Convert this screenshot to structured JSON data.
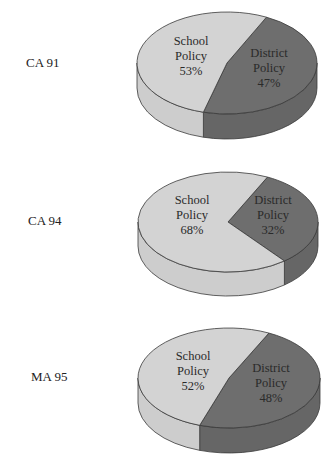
{
  "colors": {
    "school_top": "#d3d3d3",
    "school_side": "#cdcdcd",
    "district_top": "#6e6e6e",
    "district_side": "#666666",
    "outline": "#3a3a3a"
  },
  "chart_data": [
    {
      "type": "pie",
      "title": "CA 91",
      "categories": [
        "School Policy",
        "District Policy"
      ],
      "values": [
        53,
        47
      ],
      "labels": [
        [
          "School",
          "Policy",
          "53%"
        ],
        [
          "District",
          "Policy",
          "47%"
        ]
      ]
    },
    {
      "type": "pie",
      "title": "CA 94",
      "categories": [
        "School Policy",
        "District Policy"
      ],
      "values": [
        68,
        32
      ],
      "labels": [
        [
          "School",
          "Policy",
          "68%"
        ],
        [
          "District",
          "Policy",
          "32%"
        ]
      ]
    },
    {
      "type": "pie",
      "title": "MA 95",
      "categories": [
        "School Policy",
        "District Policy"
      ],
      "values": [
        52,
        48
      ],
      "labels": [
        [
          "School",
          "Policy",
          "52%"
        ],
        [
          "District",
          "Policy",
          "48%"
        ]
      ]
    }
  ]
}
